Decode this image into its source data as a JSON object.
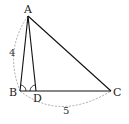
{
  "diagram": {
    "type": "geometry-triangle",
    "points": {
      "A": {
        "label": "A",
        "x": 28,
        "y": 16
      },
      "B": {
        "label": "B",
        "x": 20,
        "y": 91
      },
      "C": {
        "label": "C",
        "x": 111,
        "y": 91
      },
      "D": {
        "label": "D",
        "x": 36,
        "y": 91
      }
    },
    "segments": [
      "AB",
      "AC",
      "BC",
      "AD"
    ],
    "equal_angles": [
      "ABD",
      "ADB"
    ],
    "dimensions": {
      "AB": "4",
      "BC": "5"
    }
  }
}
